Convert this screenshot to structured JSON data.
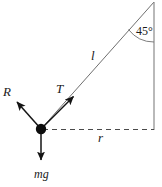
{
  "figure": {
    "background_color": "#ffffff",
    "stroke_color": "#6b6b6b",
    "bob_color": "#111111",
    "arrow_color": "#1a1a1a",
    "labels": {
      "reaction": "R",
      "tension": "T",
      "length": "l",
      "radius": "r",
      "weight": "mg",
      "angle": "45°"
    },
    "geometry": {
      "apex": {
        "x": 154,
        "y": 2
      },
      "bob": {
        "x": 41,
        "y": 129,
        "radius": 5
      },
      "right_base": {
        "x": 154,
        "y": 130
      },
      "angle_degrees": 45,
      "reaction_tip": {
        "x": 14,
        "y": 99
      },
      "tension_tip": {
        "x": 76,
        "y": 94
      },
      "weight_tip": {
        "x": 41,
        "y": 164
      }
    }
  }
}
